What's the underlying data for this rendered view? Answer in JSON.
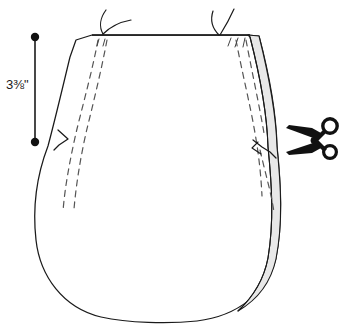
{
  "diagram": {
    "type": "line-art-illustration",
    "background_color": "#ffffff",
    "line_color": "#1a1a1a",
    "seam_fill_color": "#e8e8e8",
    "dash_color": "#555555",
    "measurement": {
      "value": "3",
      "fraction_numerator": "3",
      "fraction_denominator": "8",
      "unit": "\"",
      "full_label": "3⅜\"",
      "orientation": "vertical",
      "endpoint_style": "round-dot"
    },
    "annotations": {
      "top_left_arrow": "curved-arrow-down",
      "top_right_arrow": "curved-arrow-down",
      "scissors": "cut-here-scissors-icon"
    },
    "parts": {
      "body_outline": "rounded pouch / bag shape",
      "left_seam_dashes": "two parallel dashed stitch lines",
      "right_seam_dashes": "two parallel dashed stitch lines",
      "right_seam_strip": "shaded seam allowance strip",
      "left_notch": "step notch on left edge",
      "right_notch": "step notch on right edge"
    }
  }
}
